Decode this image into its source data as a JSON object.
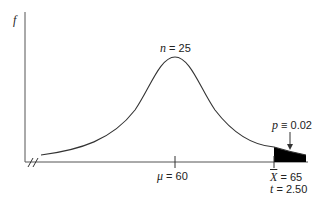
{
  "diagram": {
    "y_axis_label": "f",
    "curve_label_var": "n",
    "curve_label_eq": " = 25",
    "mean_label_var": "μ",
    "mean_label_eq": " = 60",
    "xbar_label_var": "X",
    "xbar_label_eq": " = 65",
    "t_label_var": "t",
    "t_label_eq": " = 2.50",
    "p_label_var": "p",
    "p_label_eq": " ≡ 0.02",
    "colors": {
      "line": "#333333",
      "shade": "#000000"
    }
  }
}
